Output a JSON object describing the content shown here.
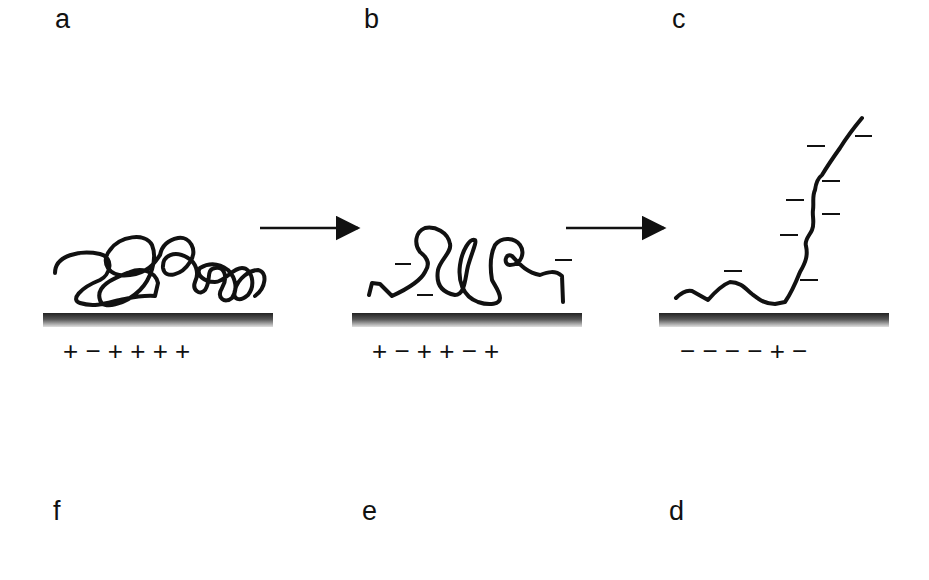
{
  "panels": [
    {
      "id": "a",
      "label": "a",
      "surface_charges": "+ − + + + +",
      "description": "coiled polymer adsorbed on mostly positive surface"
    },
    {
      "id": "b",
      "label": "b",
      "surface_charges": "+ − + + − +",
      "description": "polymer with loops, some negative charges"
    },
    {
      "id": "c",
      "label": "c",
      "surface_charges": "− − − − + −",
      "description": "extended polymer chain repelled from negative surface"
    },
    {
      "id": "d",
      "label": "d"
    },
    {
      "id": "e",
      "label": "e"
    },
    {
      "id": "f",
      "label": "f"
    }
  ],
  "arrows": [
    {
      "from": "a",
      "to": "b"
    },
    {
      "from": "b",
      "to": "c"
    }
  ],
  "colors": {
    "line": "#111111",
    "surface": "#333333",
    "background": "#ffffff"
  }
}
